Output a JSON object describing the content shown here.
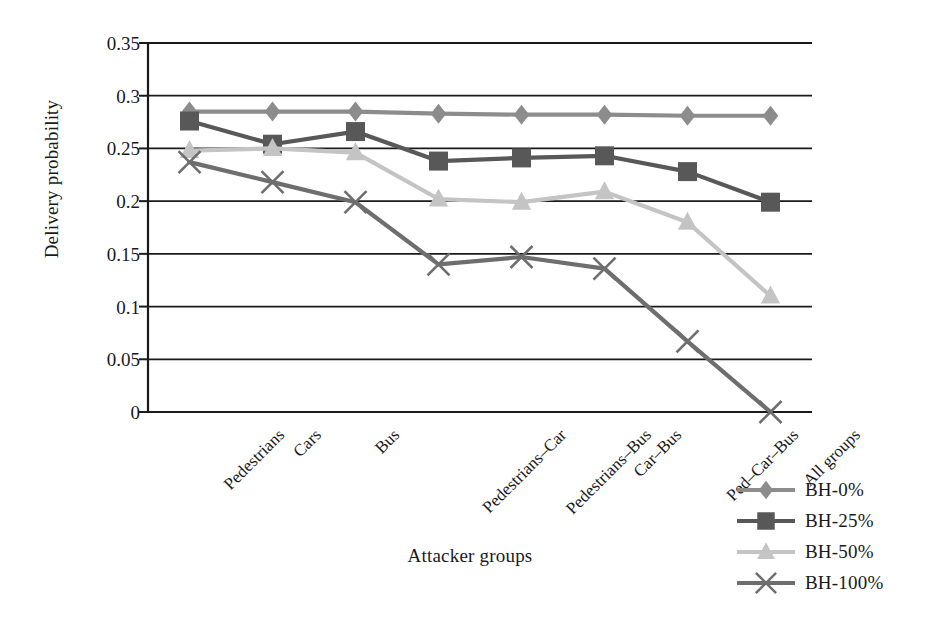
{
  "chart_data": {
    "type": "line",
    "title": "",
    "xlabel": "Attacker groups",
    "ylabel": "Delivery probability",
    "ylim": [
      0,
      0.35
    ],
    "yticks": [
      "0",
      "0.05",
      "0.1",
      "0.15",
      "0.2",
      "0.25",
      "0.3",
      "0.35"
    ],
    "ytick_values": [
      0,
      0.05,
      0.1,
      0.15,
      0.2,
      0.25,
      0.3,
      0.35
    ],
    "grid": "horizontal",
    "legend_position": "bottom-right",
    "xtick_rotation": -45,
    "categories": [
      "Pedestrians",
      "Cars",
      "Bus",
      "Pedestrians–Car",
      "Pedestrians–Bus",
      "Car–Bus",
      "Ped–Car–Bus",
      "All groups"
    ],
    "series": [
      {
        "name": "BH-0%",
        "marker": "diamond",
        "color": "#8c8c8c",
        "values": [
          0.285,
          0.285,
          0.285,
          0.283,
          0.282,
          0.282,
          0.281,
          0.281
        ]
      },
      {
        "name": "BH-25%",
        "marker": "square",
        "color": "#585858",
        "values": [
          0.276,
          0.254,
          0.266,
          0.238,
          0.241,
          0.243,
          0.228,
          0.199
        ]
      },
      {
        "name": "BH-50%",
        "marker": "triangle",
        "color": "#c4c4c4",
        "values": [
          0.248,
          0.25,
          0.246,
          0.202,
          0.199,
          0.209,
          0.18,
          0.11
        ]
      },
      {
        "name": "BH-100%",
        "marker": "cross",
        "color": "#6e6e6e",
        "values": [
          0.237,
          0.218,
          0.199,
          0.14,
          0.147,
          0.136,
          0.067,
          0.0
        ]
      }
    ]
  },
  "axis": {
    "line_color": "#1a1a1a"
  }
}
